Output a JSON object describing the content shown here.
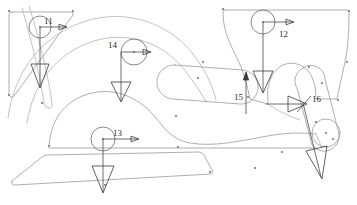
{
  "drawing": {
    "title": "Structural load annotation drawing",
    "background_color": "#ffffff",
    "outline_color": "#9a9a9a",
    "annotation_color": "#3a3a3a",
    "label_color": "#2b2b2b"
  },
  "labels": [
    {
      "id": "11",
      "text": "11",
      "x": 44,
      "y": 21
    },
    {
      "id": "12",
      "text": "12",
      "x": 281,
      "y": 33
    },
    {
      "id": "13",
      "text": "13",
      "x": 115,
      "y": 138
    },
    {
      "id": "14",
      "text": "14",
      "x": 110,
      "y": 46
    },
    {
      "id": "15",
      "text": "15",
      "x": 236,
      "y": 95
    },
    {
      "id": "16",
      "text": "16",
      "x": 315,
      "y": 102
    }
  ],
  "load_markers": [
    {
      "name": "load-marker-11",
      "label": "11",
      "circle": {
        "cx": 40,
        "cy": 27,
        "r": 11
      },
      "horizontal_arrow": {
        "x1": 40,
        "y1": 27,
        "x2": 68,
        "y2": 27
      },
      "vertical_arrow": {
        "x1": 40,
        "y1": 27,
        "x2": 40,
        "y2": 86
      }
    },
    {
      "name": "load-marker-12",
      "label": "12",
      "circle": {
        "cx": 263,
        "cy": 22,
        "r": 12
      },
      "horizontal_arrow": {
        "x1": 263,
        "y1": 22,
        "x2": 296,
        "y2": 22
      },
      "vertical_arrow": {
        "x1": 263,
        "y1": 22,
        "x2": 263,
        "y2": 92
      }
    },
    {
      "name": "load-marker-13",
      "label": "13",
      "circle": {
        "cx": 103,
        "cy": 139,
        "r": 12
      },
      "horizontal_arrow": {
        "x1": 103,
        "y1": 139,
        "x2": 140,
        "y2": 139
      },
      "vertical_arrow": {
        "x1": 103,
        "y1": 139,
        "x2": 103,
        "y2": 193
      }
    },
    {
      "name": "load-marker-14",
      "label": "14",
      "circle": {
        "cx": 134,
        "cy": 52,
        "r": 13
      },
      "horizontal_arrow": {
        "x1": 121,
        "y1": 52,
        "x2": 152,
        "y2": 52
      },
      "vertical_arrow": {
        "x1": 121,
        "y1": 52,
        "x2": 121,
        "y2": 101
      }
    },
    {
      "name": "load-marker-15",
      "label": "15",
      "vertical_arrow_up": {
        "x1": 246,
        "y1": 113,
        "x2": 246,
        "y2": 74
      }
    },
    {
      "name": "load-marker-16",
      "label": "16",
      "horizontal_arrow": {
        "x1": 268,
        "y1": 104,
        "x2": 306,
        "y2": 104
      },
      "diagonal_arrow": {
        "x1": 306,
        "y1": 104,
        "x2": 320,
        "y2": 178
      }
    }
  ],
  "geometry": {
    "left_panel": "rounded wedge bracket, upper-left",
    "right_panel": "large curved sweep panel, upper-right",
    "center_slot": "horizontal capsule slot",
    "right_slot": "inclined capsule slot",
    "lower_plate": "long tapered base plate",
    "arc_members": "nested sweeping arcs, left and center"
  },
  "vertex_dots": [
    {
      "x": 9,
      "y": 11
    },
    {
      "x": 73,
      "y": 11
    },
    {
      "x": 9,
      "y": 95
    },
    {
      "x": 223,
      "y": 9
    },
    {
      "x": 349,
      "y": 11
    },
    {
      "x": 347,
      "y": 62
    },
    {
      "x": 338,
      "y": 100
    },
    {
      "x": 248,
      "y": 97
    },
    {
      "x": 198,
      "y": 78
    },
    {
      "x": 49,
      "y": 146
    },
    {
      "x": 176,
      "y": 116
    },
    {
      "x": 210,
      "y": 172
    },
    {
      "x": 178,
      "y": 147
    },
    {
      "x": 316,
      "y": 122
    },
    {
      "x": 333,
      "y": 139
    },
    {
      "x": 309,
      "y": 67
    },
    {
      "x": 42,
      "y": 103
    },
    {
      "x": 282,
      "y": 152
    },
    {
      "x": 255,
      "y": 168
    },
    {
      "x": 322,
      "y": 83
    },
    {
      "x": 105,
      "y": 185
    }
  ]
}
